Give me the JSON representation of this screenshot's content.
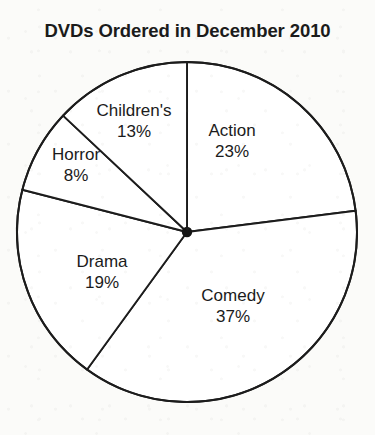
{
  "chart_data": {
    "type": "pie",
    "title": "DVDs Ordered in December 2010",
    "xlabel": "",
    "ylabel": "",
    "legend_position": "none",
    "grid": false,
    "units": "percent",
    "start_angle_deg": 0,
    "direction": "clockwise",
    "categories": [
      "Action",
      "Comedy",
      "Drama",
      "Horror",
      "Children's"
    ],
    "values": [
      23,
      37,
      19,
      8,
      13
    ],
    "value_labels": [
      "23%",
      "37%",
      "19%",
      "8%",
      "13%"
    ],
    "total": 100,
    "slices": [
      {
        "name": "Action",
        "value": 23,
        "value_label": "23%",
        "start_deg": 0,
        "end_deg": 82.8,
        "fill": "#ffffff",
        "stroke": "#1c1c1c",
        "label_x": 232,
        "label_y": 141
      },
      {
        "name": "Comedy",
        "value": 37,
        "value_label": "37%",
        "start_deg": 82.8,
        "end_deg": 216.0,
        "fill": "#ffffff",
        "stroke": "#1c1c1c",
        "label_x": 233,
        "label_y": 306
      },
      {
        "name": "Drama",
        "value": 19,
        "value_label": "19%",
        "start_deg": 216.0,
        "end_deg": 284.4,
        "fill": "#ffffff",
        "stroke": "#1c1c1c",
        "label_x": 102,
        "label_y": 272
      },
      {
        "name": "Horror",
        "value": 8,
        "value_label": "8%",
        "start_deg": 284.4,
        "end_deg": 313.2,
        "fill": "#ffffff",
        "stroke": "#1c1c1c",
        "label_x": 76,
        "label_y": 165
      },
      {
        "name": "Children's",
        "value": 13,
        "value_label": "13%",
        "start_deg": 313.2,
        "end_deg": 360,
        "fill": "#ffffff",
        "stroke": "#1c1c1c",
        "label_x": 134,
        "label_y": 121
      }
    ],
    "geometry": {
      "center_x": 187,
      "center_y": 232,
      "radius": 170
    },
    "colors": {
      "background": "#fbfbf9",
      "ink": "#1c1c1c",
      "slice_fill": "#ffffff"
    }
  }
}
